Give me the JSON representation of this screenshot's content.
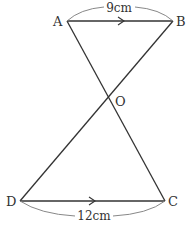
{
  "diagram": {
    "points": {
      "A": {
        "label": "A",
        "x": 67,
        "y": 21
      },
      "B": {
        "label": "B",
        "x": 173,
        "y": 21
      },
      "O": {
        "label": "O",
        "x": 110,
        "y": 96
      },
      "D": {
        "label": "D",
        "x": 20,
        "y": 201
      },
      "C": {
        "label": "C",
        "x": 165,
        "y": 201
      }
    },
    "segments": [
      "AB",
      "AC",
      "BD",
      "DC"
    ],
    "parallel_marks": [
      "AB",
      "DC"
    ],
    "measurements": {
      "AB": "9cm",
      "DC": "12cm"
    }
  }
}
